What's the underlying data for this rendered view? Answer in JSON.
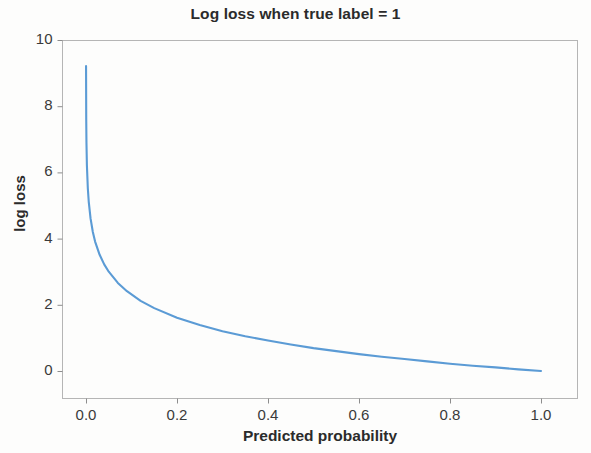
{
  "chart_data": {
    "type": "line",
    "title": "Log loss when true label = 1",
    "xlabel": "Predicted probability",
    "ylabel": "log loss",
    "xlim": [
      -0.05,
      1.08
    ],
    "ylim": [
      -0.6,
      10.4
    ],
    "grid": false,
    "legend": null,
    "line_color": "#5b9bd5",
    "formula": "log loss = -ln(predicted probability)",
    "xticks": [
      0.0,
      0.2,
      0.4,
      0.6,
      0.8,
      1.0
    ],
    "xticklabels": [
      "0.0",
      "0.2",
      "0.4",
      "0.6",
      "0.8",
      "1.0"
    ],
    "yticks": [
      0,
      2,
      4,
      6,
      8,
      10
    ],
    "yticklabels": [
      "0",
      "2",
      "4",
      "6",
      "8",
      "10"
    ],
    "series": [
      {
        "name": "log loss",
        "x": [
          0.0001,
          0.0005,
          0.001,
          0.002,
          0.004,
          0.006,
          0.01,
          0.015,
          0.02,
          0.03,
          0.04,
          0.05,
          0.07,
          0.09,
          0.12,
          0.15,
          0.2,
          0.25,
          0.3,
          0.35,
          0.4,
          0.45,
          0.5,
          0.55,
          0.6,
          0.65,
          0.7,
          0.75,
          0.8,
          0.85,
          0.9,
          0.95,
          1.0
        ],
        "y": [
          9.21,
          7.6,
          6.91,
          6.21,
          5.52,
          5.12,
          4.61,
          4.2,
          3.91,
          3.51,
          3.22,
          3.0,
          2.66,
          2.41,
          2.12,
          1.9,
          1.61,
          1.39,
          1.2,
          1.05,
          0.92,
          0.8,
          0.69,
          0.6,
          0.51,
          0.43,
          0.36,
          0.29,
          0.22,
          0.16,
          0.11,
          0.05,
          0.0
        ]
      }
    ]
  }
}
